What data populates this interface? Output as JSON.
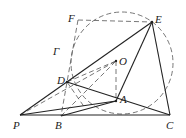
{
  "figure": {
    "type": "geometry",
    "points": {
      "F": {
        "label": "F",
        "x": 78,
        "y": 20
      },
      "E": {
        "label": "E",
        "x": 152,
        "y": 22
      },
      "O": {
        "label": "O",
        "x": 116,
        "y": 61
      },
      "D": {
        "label": "D",
        "x": 67,
        "y": 82
      },
      "A": {
        "label": "A",
        "x": 116,
        "y": 101
      },
      "P": {
        "label": "P",
        "x": 20,
        "y": 115
      },
      "B": {
        "label": "B",
        "x": 61,
        "y": 116
      },
      "C": {
        "label": "C",
        "x": 170,
        "y": 115
      }
    },
    "circle_label": "Γ",
    "stroke_color": "#222222",
    "dash_color": "#555555"
  }
}
